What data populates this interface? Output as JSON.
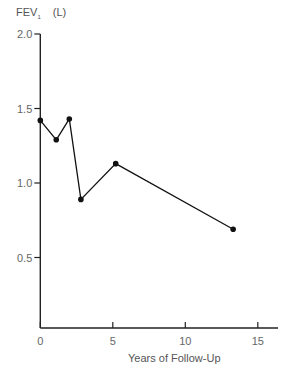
{
  "chart_data": {
    "type": "line",
    "title": "",
    "xlabel": "Years of Follow-Up",
    "ylabel": "FEV1 (L)",
    "ylabel_main": "FEV",
    "ylabel_sub": "1",
    "ylabel_unit": "(L)",
    "x": [
      0,
      1.1,
      2.0,
      2.8,
      5.2,
      13.3
    ],
    "values": [
      1.42,
      1.29,
      1.43,
      0.89,
      1.13,
      0.69
    ],
    "xlim": [
      0,
      16
    ],
    "ylim": [
      0,
      2.0
    ],
    "xticks": [
      0,
      5,
      10,
      15
    ],
    "xtick_labels": [
      "0",
      "5",
      "10",
      "15"
    ],
    "yticks": [
      0.5,
      1.0,
      1.5,
      2.0
    ],
    "ytick_labels": [
      "0.5",
      "1.0",
      "1.5",
      "2.0"
    ],
    "grid": false,
    "legend": null,
    "marker": "filled-circle",
    "line_color": "#111111"
  }
}
